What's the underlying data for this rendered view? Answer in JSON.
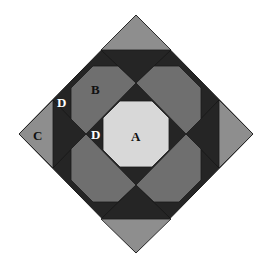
{
  "diagram": {
    "title": "",
    "colors": {
      "background": "#ffffff",
      "outline": "#1a1a1a",
      "region_a": "#d8d8d8",
      "region_b": "#6f6f6f",
      "region_c": "#8e8e8e",
      "region_d": "#252525"
    },
    "labels": {
      "a": "A",
      "b": "B",
      "c": "C",
      "d_upper": "D",
      "d_center": "D"
    }
  }
}
